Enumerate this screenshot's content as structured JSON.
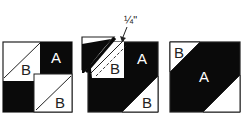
{
  "diagram": {
    "colors": {
      "dark": "#0a0a0a",
      "light": "#ffffff",
      "stroke": "#222222"
    },
    "block1": {
      "label_a": "A",
      "label_b_top": "B",
      "label_b_bottom": "B"
    },
    "block2": {
      "label_a": "A",
      "label_b_middle": "B",
      "label_b_bottom": "B",
      "seam_annotation": "¼\""
    },
    "block3": {
      "label_a": "A",
      "label_b": "B"
    }
  }
}
